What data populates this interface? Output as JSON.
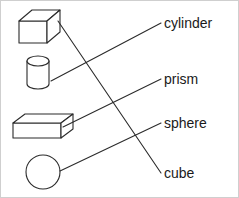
{
  "page": {
    "background_color": "#ffffff",
    "border_color": "#cfcfcf",
    "ink_color": "#2b2b2b",
    "width": 239,
    "height": 198
  },
  "labels": [
    {
      "id": "cylinder",
      "text": "cylinder",
      "x": 163,
      "y": 15
    },
    {
      "id": "prism",
      "text": "prism",
      "x": 163,
      "y": 71
    },
    {
      "id": "sphere",
      "text": "sphere",
      "x": 163,
      "y": 115
    },
    {
      "id": "cube",
      "text": "cube",
      "x": 163,
      "y": 165
    }
  ],
  "shapes": [
    {
      "id": "cube",
      "name": "cube-figure",
      "description": "3D cube drawn in oblique projection",
      "x": 18,
      "y": 9,
      "width": 42,
      "height": 33
    },
    {
      "id": "cylinder",
      "name": "cylinder-figure",
      "description": "upright cylinder with elliptical top",
      "x": 26,
      "y": 55,
      "width": 22,
      "height": 33
    },
    {
      "id": "prism",
      "name": "prism-figure",
      "description": "rectangular prism box drawn in oblique projection",
      "x": 12,
      "y": 113,
      "width": 60,
      "height": 24
    },
    {
      "id": "sphere",
      "name": "sphere-figure",
      "description": "circle representing a sphere",
      "x": 25,
      "y": 154,
      "width": 34,
      "height": 34
    }
  ],
  "connectors": [
    {
      "id": "cube-to-cube",
      "from_shape": "cube",
      "to_label": "cube",
      "x1": 57,
      "y1": 20,
      "x2": 160,
      "y2": 172
    },
    {
      "id": "cylinder-to-cylinder",
      "from_shape": "cylinder",
      "to_label": "cylinder",
      "x1": 50,
      "y1": 80,
      "x2": 160,
      "y2": 22
    },
    {
      "id": "prism-to-prism",
      "from_shape": "prism",
      "to_label": "prism",
      "x1": 62,
      "y1": 126,
      "x2": 160,
      "y2": 78
    },
    {
      "id": "sphere-to-sphere",
      "from_shape": "sphere",
      "to_label": "sphere",
      "x1": 59,
      "y1": 170,
      "x2": 160,
      "y2": 122
    }
  ]
}
